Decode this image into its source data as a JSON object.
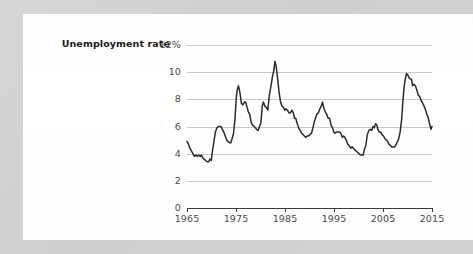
{
  "card": {
    "background_color": "#fdfdfd",
    "backdrop_color": "#d3d3d3"
  },
  "labels": {
    "series_title": "Unemployment rate"
  },
  "chart_data": {
    "type": "line",
    "title": "Unemployment rate",
    "xlabel": "",
    "ylabel": "",
    "xlim": [
      1965,
      2015
    ],
    "ylim": [
      0,
      12
    ],
    "grid": true,
    "legend_position": "inline-left",
    "line_color": "#2b2b2b",
    "grid_color": "#c8c8c8",
    "axis_color": "#3a3a3a",
    "x_ticks": [
      1965,
      1975,
      1985,
      1995,
      2005,
      2015
    ],
    "x_tick_labels": [
      "1965",
      "1975",
      "1985",
      "1995",
      "2005",
      "2015"
    ],
    "y_ticks": [
      0,
      2,
      4,
      6,
      8,
      10,
      12
    ],
    "y_tick_labels": [
      "0",
      "2",
      "4",
      "6",
      "8",
      "10",
      "12%"
    ],
    "series": [
      {
        "name": "Unemployment rate",
        "unit": "percent",
        "x": [
          1965.0,
          1965.3,
          1965.6,
          1965.9,
          1966.2,
          1966.5,
          1966.8,
          1967.1,
          1967.4,
          1967.7,
          1967.95,
          1968.2,
          1968.5,
          1968.8,
          1969.1,
          1969.4,
          1969.7,
          1969.95,
          1970.2,
          1970.5,
          1970.8,
          1971.1,
          1971.4,
          1971.7,
          1971.95,
          1972.2,
          1972.5,
          1972.8,
          1973.1,
          1973.4,
          1973.7,
          1973.95,
          1974.2,
          1974.5,
          1974.8,
          1975.05,
          1975.25,
          1975.5,
          1975.8,
          1976.1,
          1976.4,
          1976.7,
          1976.95,
          1977.2,
          1977.5,
          1977.8,
          1978.1,
          1978.4,
          1978.7,
          1978.95,
          1979.2,
          1979.5,
          1979.8,
          1980.1,
          1980.35,
          1980.6,
          1980.9,
          1981.2,
          1981.5,
          1981.8,
          1982.1,
          1982.4,
          1982.7,
          1982.95,
          1983.2,
          1983.5,
          1983.8,
          1984.1,
          1984.4,
          1984.7,
          1984.95,
          1985.2,
          1985.5,
          1985.8,
          1986.1,
          1986.4,
          1986.7,
          1986.95,
          1987.2,
          1987.5,
          1987.8,
          1988.1,
          1988.4,
          1988.7,
          1988.95,
          1989.2,
          1989.5,
          1989.8,
          1990.1,
          1990.4,
          1990.7,
          1990.95,
          1991.2,
          1991.5,
          1991.8,
          1992.1,
          1992.4,
          1992.65,
          1992.9,
          1993.2,
          1993.5,
          1993.8,
          1994.1,
          1994.4,
          1994.7,
          1994.95,
          1995.2,
          1995.5,
          1995.8,
          1996.1,
          1996.4,
          1996.7,
          1996.95,
          1997.2,
          1997.5,
          1997.8,
          1998.1,
          1998.4,
          1998.7,
          1998.95,
          1999.2,
          1999.5,
          1999.8,
          2000.1,
          2000.4,
          2000.7,
          2000.95,
          2001.2,
          2001.5,
          2001.8,
          2002.1,
          2002.4,
          2002.7,
          2002.95,
          2003.2,
          2003.5,
          2003.75,
          2003.95,
          2004.2,
          2004.5,
          2004.8,
          2005.1,
          2005.4,
          2005.7,
          2005.95,
          2006.2,
          2006.5,
          2006.8,
          2007.1,
          2007.4,
          2007.7,
          2007.95,
          2008.2,
          2008.5,
          2008.8,
          2009.05,
          2009.3,
          2009.55,
          2009.8,
          2010.05,
          2010.3,
          2010.55,
          2010.8,
          2011.05,
          2011.3,
          2011.6,
          2011.9,
          2012.2,
          2012.5,
          2012.8,
          2013.1,
          2013.4,
          2013.7,
          2013.95,
          2014.2,
          2014.5,
          2014.8,
          2015.0
        ],
        "y": [
          4.9,
          4.7,
          4.4,
          4.2,
          4.0,
          3.8,
          3.9,
          3.8,
          3.9,
          3.8,
          3.9,
          3.7,
          3.6,
          3.5,
          3.4,
          3.4,
          3.6,
          3.5,
          4.2,
          4.9,
          5.6,
          5.9,
          6.0,
          6.0,
          6.0,
          5.8,
          5.6,
          5.3,
          5.0,
          4.9,
          4.8,
          4.8,
          5.1,
          5.5,
          6.6,
          8.1,
          8.7,
          9.0,
          8.5,
          7.7,
          7.6,
          7.8,
          7.8,
          7.5,
          7.1,
          6.9,
          6.3,
          6.1,
          6.0,
          5.9,
          5.8,
          5.7,
          6.0,
          6.3,
          7.5,
          7.8,
          7.5,
          7.4,
          7.2,
          8.3,
          8.9,
          9.6,
          10.1,
          10.8,
          10.4,
          9.5,
          8.5,
          7.8,
          7.5,
          7.4,
          7.2,
          7.3,
          7.2,
          7.0,
          7.0,
          7.2,
          7.0,
          6.6,
          6.6,
          6.2,
          5.9,
          5.7,
          5.5,
          5.4,
          5.3,
          5.2,
          5.3,
          5.3,
          5.4,
          5.5,
          5.9,
          6.3,
          6.6,
          6.9,
          7.0,
          7.3,
          7.5,
          7.8,
          7.4,
          7.1,
          6.9,
          6.6,
          6.6,
          6.1,
          5.9,
          5.6,
          5.5,
          5.6,
          5.6,
          5.6,
          5.5,
          5.2,
          5.3,
          5.2,
          5.0,
          4.7,
          4.6,
          4.4,
          4.5,
          4.4,
          4.3,
          4.2,
          4.1,
          4.0,
          3.9,
          3.9,
          3.9,
          4.3,
          4.6,
          5.4,
          5.7,
          5.8,
          5.7,
          6.0,
          5.9,
          6.2,
          6.1,
          5.8,
          5.6,
          5.6,
          5.4,
          5.3,
          5.1,
          5.0,
          4.9,
          4.7,
          4.6,
          4.5,
          4.5,
          4.5,
          4.7,
          4.9,
          5.1,
          5.6,
          6.5,
          7.8,
          8.9,
          9.5,
          9.9,
          9.8,
          9.6,
          9.5,
          9.5,
          9.0,
          9.1,
          9.0,
          8.7,
          8.3,
          8.2,
          7.9,
          7.7,
          7.5,
          7.2,
          6.9,
          6.7,
          6.2,
          5.8,
          6.0
        ]
      }
    ],
    "annotations": {
      "peaks": [
        {
          "year": 1971,
          "value": 6.0
        },
        {
          "year": 1975,
          "value": 9.0
        },
        {
          "year": 1982,
          "value": 10.8
        },
        {
          "year": 1992,
          "value": 7.8
        },
        {
          "year": 2009,
          "value": 10.0
        }
      ],
      "troughs": [
        {
          "year": 1969,
          "value": 3.4
        },
        {
          "year": 2000,
          "value": 3.9
        },
        {
          "year": 2007,
          "value": 4.5
        }
      ]
    }
  }
}
